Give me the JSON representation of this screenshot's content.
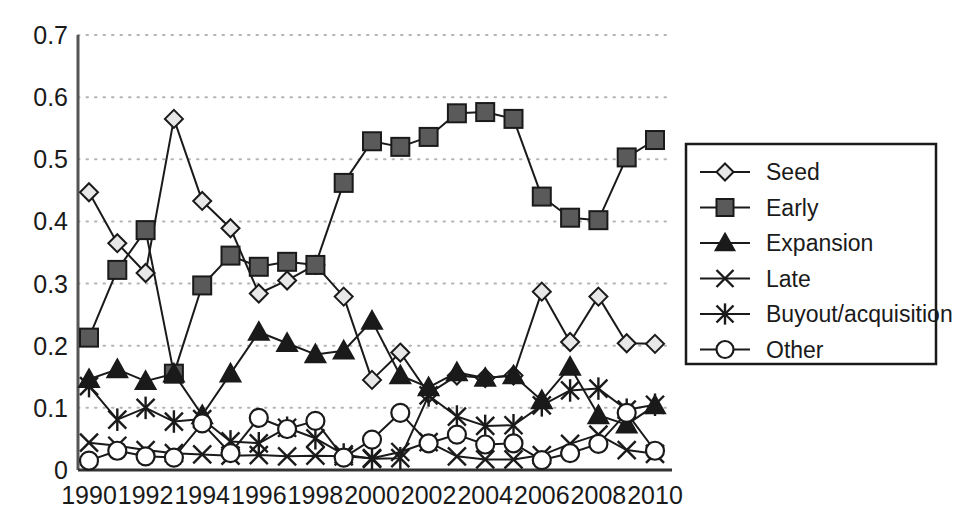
{
  "chart_data": {
    "type": "line",
    "title": "",
    "subtitle": "",
    "xlabel": "",
    "ylabel": "",
    "xlim": [
      1990,
      2010
    ],
    "ylim": [
      0,
      0.7
    ],
    "grid": true,
    "grid_axis": "y",
    "legend_position": "right",
    "x": [
      1990,
      1991,
      1992,
      1993,
      1994,
      1995,
      1996,
      1997,
      1998,
      1999,
      2000,
      2001,
      2002,
      2003,
      2004,
      2005,
      2006,
      2007,
      2008,
      2009,
      2010
    ],
    "y_tick_labels": [
      "0",
      "0.1",
      "0.2",
      "0.3",
      "0.4",
      "0.5",
      "0.6",
      "0.7"
    ],
    "y_ticks": [
      0,
      0.1,
      0.2,
      0.3,
      0.4,
      0.5,
      0.6,
      0.7
    ],
    "x_tick_labels": [
      "1990",
      "1992",
      "1994",
      "1996",
      "1998",
      "2000",
      "2002",
      "2004",
      "2006",
      "2008",
      "2010"
    ],
    "x_ticks": [
      1990,
      1992,
      1994,
      1996,
      1998,
      2000,
      2002,
      2004,
      2006,
      2008,
      2010
    ],
    "series": [
      {
        "name": "Seed",
        "marker": "diamond",
        "marker_fill": "#e8e8e8",
        "line_color": "#1a1a1a",
        "values": [
          0.447,
          0.365,
          0.317,
          0.565,
          0.433,
          0.389,
          0.284,
          0.305,
          0.33,
          0.279,
          0.145,
          0.189,
          0.123,
          0.152,
          0.148,
          0.152,
          0.287,
          0.206,
          0.279,
          0.204,
          0.203
        ]
      },
      {
        "name": "Early",
        "marker": "square",
        "marker_fill": "#5a5a5a",
        "line_color": "#1a1a1a",
        "values": [
          0.213,
          0.322,
          0.386,
          0.155,
          0.297,
          0.345,
          0.327,
          0.335,
          0.33,
          0.462,
          0.529,
          0.52,
          0.536,
          0.574,
          0.576,
          0.565,
          0.44,
          0.406,
          0.402,
          0.503,
          0.531
        ]
      },
      {
        "name": "Expansion",
        "marker": "triangle",
        "marker_fill": "#1a1a1a",
        "line_color": "#1a1a1a",
        "values": [
          0.146,
          0.162,
          0.143,
          0.155,
          0.088,
          0.155,
          0.222,
          0.204,
          0.186,
          0.192,
          0.24,
          0.152,
          0.133,
          0.157,
          0.148,
          0.152,
          0.112,
          0.166,
          0.088,
          0.073,
          0.104
        ]
      },
      {
        "name": "Late",
        "marker": "cross",
        "marker_fill": "none",
        "line_color": "#1a1a1a",
        "values": [
          0.044,
          0.039,
          0.032,
          0.027,
          0.025,
          0.023,
          0.024,
          0.022,
          0.023,
          0.022,
          0.019,
          0.029,
          0.045,
          0.022,
          0.017,
          0.017,
          0.024,
          0.042,
          0.057,
          0.032,
          0.026
        ]
      },
      {
        "name": "Buyout/acquisition",
        "marker": "asterisk",
        "marker_fill": "none",
        "line_color": "#1a1a1a",
        "values": [
          0.135,
          0.081,
          0.1,
          0.078,
          0.082,
          0.046,
          0.043,
          0.068,
          0.051,
          0.025,
          0.018,
          0.019,
          0.12,
          0.086,
          0.071,
          0.072,
          0.104,
          0.128,
          0.131,
          0.097,
          0.105
        ]
      },
      {
        "name": "Other",
        "marker": "circle",
        "marker_fill": "#ffffff",
        "line_color": "#1a1a1a",
        "values": [
          0.015,
          0.031,
          0.022,
          0.02,
          0.075,
          0.027,
          0.084,
          0.066,
          0.079,
          0.02,
          0.049,
          0.092,
          0.043,
          0.057,
          0.041,
          0.043,
          0.016,
          0.027,
          0.042,
          0.092,
          0.031
        ]
      }
    ],
    "legend": [
      "Seed",
      "Early",
      "Expansion",
      "Late",
      "Buyout/acquisition",
      "Other"
    ],
    "colors": {
      "axis": "#1a1a1a",
      "grid": "#b4b4b4",
      "background": "#ffffff",
      "seed_marker": "#e8e8e8",
      "early_marker": "#5a5a5a",
      "expansion_marker": "#1a1a1a"
    }
  }
}
